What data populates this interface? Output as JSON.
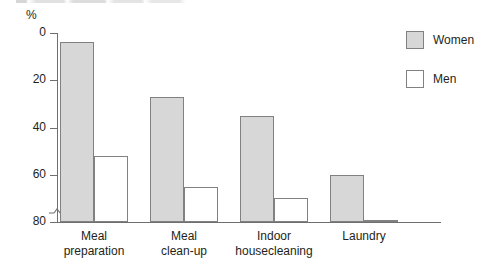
{
  "caption_remnant": "",
  "axis": {
    "unit_label": "%",
    "y_ticks": [
      "80",
      "60",
      "40",
      "20",
      "0"
    ],
    "break_marker_icon": "axis-break-icon"
  },
  "legend": {
    "items": [
      {
        "label": "Women",
        "swatch": "women",
        "color": "#d7d7d7"
      },
      {
        "label": "Men",
        "swatch": "men",
        "color": "#ffffff"
      }
    ]
  },
  "chart_data": {
    "type": "bar",
    "title": "",
    "xlabel": "",
    "ylabel": "%",
    "ylim": [
      0,
      80
    ],
    "yticks": [
      0,
      20,
      40,
      60,
      80
    ],
    "grid": false,
    "legend_position": "top-right",
    "axis_break_near_zero": true,
    "categories": [
      "Meal preparation",
      "Meal clean-up",
      "Indoor housecleaning",
      "Laundry"
    ],
    "category_lines": [
      [
        "Meal",
        "preparation"
      ],
      [
        "Meal",
        "clean-up"
      ],
      [
        "Indoor",
        "housecleaning"
      ],
      [
        "Laundry",
        ""
      ]
    ],
    "series": [
      {
        "name": "Women",
        "color": "#d7d7d7",
        "values": [
          76,
          53,
          45,
          20
        ]
      },
      {
        "name": "Men",
        "color": "#ffffff",
        "values": [
          28,
          15,
          10,
          1
        ]
      }
    ]
  }
}
